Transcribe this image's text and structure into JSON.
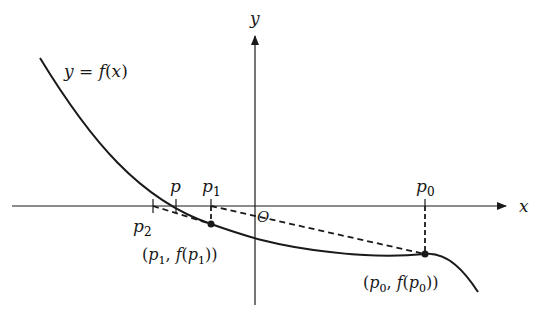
{
  "figure": {
    "colors": {
      "background": "#ffffff",
      "ink": "#1a1a1a"
    },
    "axes": {
      "x_label": "x",
      "y_label": "y",
      "origin_label": "O"
    },
    "curve": {
      "label": "y = f(x)",
      "label_parts": [
        "y",
        " = ",
        "f",
        "(",
        "x",
        ")"
      ]
    },
    "ticks": [
      {
        "id": "p2",
        "base": "p",
        "sub": "2"
      },
      {
        "id": "p",
        "base": "p",
        "sub": ""
      },
      {
        "id": "p1",
        "base": "p",
        "sub": "1"
      },
      {
        "id": "p0",
        "base": "p",
        "sub": "0"
      }
    ],
    "points": [
      {
        "id": "p1-point",
        "label": "(p1, f(p1))",
        "parts": [
          "(",
          "p",
          "1",
          ", ",
          "f",
          "(",
          "p",
          "1",
          "))"
        ]
      },
      {
        "id": "p0-point",
        "label": "(p0, f(p0))",
        "parts": [
          "(",
          "p",
          "0",
          ", ",
          "f",
          "(",
          "p",
          "0",
          "))"
        ]
      }
    ],
    "text": {
      "y_eq": "y",
      "eq": " = ",
      "f": "f",
      "open": "(",
      "x": "x",
      "close": ")",
      "p": "p",
      "sub0": "0",
      "sub1": "1",
      "sub2": "2",
      "comma": ", ",
      "close2": "))"
    }
  }
}
